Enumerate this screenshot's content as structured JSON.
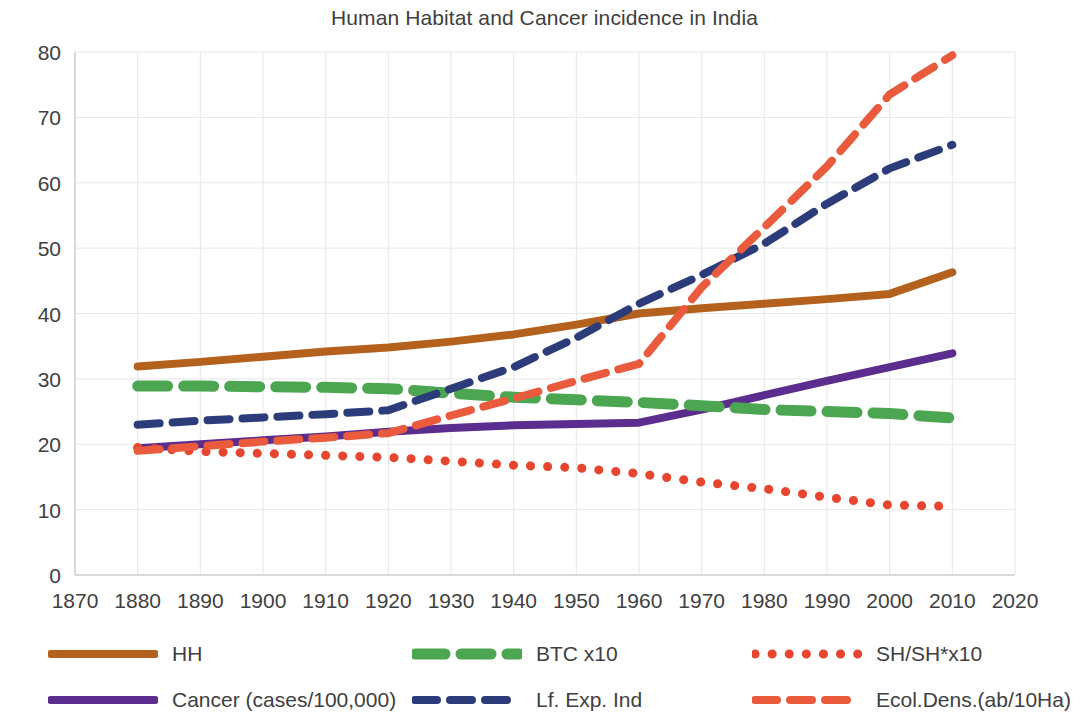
{
  "title": "Human Habitat and Cancer incidence in India",
  "axes": {
    "x_ticks": [
      "1870",
      "1880",
      "1890",
      "1900",
      "1910",
      "1920",
      "1930",
      "1940",
      "1950",
      "1960",
      "1970",
      "1980",
      "1990",
      "2000",
      "2010",
      "2020"
    ],
    "y_ticks": [
      "0",
      "10",
      "20",
      "30",
      "40",
      "50",
      "60",
      "70",
      "80"
    ],
    "xlim": [
      1870,
      2020
    ],
    "ylim": [
      0,
      80
    ],
    "xlabel": "",
    "ylabel": "",
    "grid": true
  },
  "colors": {
    "hh": "#B5611E",
    "cancer": "#5B2D8E",
    "btc": "#4CA550",
    "life_exp": "#2C3C7A",
    "sh": "#E8452E",
    "ecol_dens": "#EA5A3D",
    "grid": "#E6E6E6",
    "axis": "#D0D0D0",
    "text": "#404040"
  },
  "legend": {
    "position": "bottom",
    "items": [
      {
        "label": "HH",
        "color_key": "hh",
        "style": "solid",
        "row": 1,
        "col": 1
      },
      {
        "label": "BTC x10",
        "color_key": "btc",
        "style": "dashed-thick",
        "row": 1,
        "col": 2
      },
      {
        "label": "SH/SH*x10",
        "color_key": "sh",
        "style": "dotted",
        "row": 1,
        "col": 3
      },
      {
        "label": "Cancer (cases/100,000)",
        "color_key": "cancer",
        "style": "solid",
        "row": 2,
        "col": 1
      },
      {
        "label": "Lf. Exp. Ind",
        "color_key": "life_exp",
        "style": "dashed",
        "row": 2,
        "col": 2
      },
      {
        "label": "Ecol.Dens.(ab/10Ha)",
        "color_key": "ecol_dens",
        "style": "dashed",
        "row": 2,
        "col": 3
      }
    ]
  },
  "chart_data": {
    "type": "line",
    "title": "Human Habitat and Cancer incidence in India",
    "xlabel": "",
    "ylabel": "",
    "xlim": [
      1870,
      2020
    ],
    "ylim": [
      0,
      80
    ],
    "grid": true,
    "legend_position": "bottom",
    "x": [
      1880,
      1890,
      1900,
      1910,
      1920,
      1930,
      1940,
      1950,
      1960,
      1970,
      1980,
      1990,
      2000,
      2010
    ],
    "series": [
      {
        "name": "HH",
        "color": "#B5611E",
        "style": "solid",
        "values": [
          31.9,
          32.6,
          33.4,
          34.2,
          34.8,
          35.7,
          36.8,
          38.3,
          40.0,
          40.8,
          41.5,
          42.2,
          43.0,
          46.3
        ]
      },
      {
        "name": "Cancer (cases/100,000)",
        "color": "#5B2D8E",
        "style": "solid",
        "values": [
          19.4,
          20.0,
          20.6,
          21.2,
          21.9,
          22.5,
          22.9,
          23.1,
          23.3,
          25.3,
          27.5,
          29.7,
          31.8,
          33.9
        ]
      },
      {
        "name": "BTC x10",
        "color": "#4CA550",
        "style": "dashed-thick",
        "values": [
          28.9,
          28.9,
          28.8,
          28.7,
          28.5,
          27.8,
          27.2,
          26.8,
          26.4,
          25.9,
          25.3,
          25.0,
          24.7,
          24.0
        ]
      },
      {
        "name": "Lf. Exp. Ind",
        "color": "#2C3C7A",
        "style": "dashed",
        "values": [
          23.0,
          23.6,
          24.1,
          24.6,
          25.2,
          28.5,
          31.8,
          36.3,
          41.5,
          45.9,
          50.7,
          56.8,
          62.2,
          65.8
        ]
      },
      {
        "name": "SH/SH*x10",
        "color": "#E8452E",
        "style": "dotted",
        "values": [
          19.5,
          18.9,
          18.6,
          18.3,
          18.0,
          17.4,
          16.8,
          16.4,
          15.5,
          14.2,
          13.2,
          11.9,
          10.7,
          10.5
        ]
      },
      {
        "name": "Ecol.Dens.(ab/10Ha)",
        "color": "#EA5A3D",
        "style": "dashed",
        "values": [
          19.0,
          19.7,
          20.4,
          21.0,
          21.7,
          24.4,
          27.0,
          29.7,
          32.3,
          44.0,
          53.2,
          62.5,
          73.5,
          79.5
        ]
      }
    ]
  }
}
